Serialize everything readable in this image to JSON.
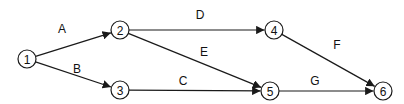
{
  "diagram": {
    "type": "activity-on-arrow network",
    "nodes": [
      {
        "id": "1",
        "label": "1",
        "x": 27,
        "y": 59
      },
      {
        "id": "2",
        "label": "2",
        "x": 120,
        "y": 30
      },
      {
        "id": "3",
        "label": "3",
        "x": 120,
        "y": 90
      },
      {
        "id": "4",
        "label": "4",
        "x": 274,
        "y": 30
      },
      {
        "id": "5",
        "label": "5",
        "x": 270,
        "y": 91
      },
      {
        "id": "6",
        "label": "6",
        "x": 383,
        "y": 91
      }
    ],
    "edges": [
      {
        "label": "A",
        "from": "1",
        "to": "2",
        "lx": 62,
        "ly": 29
      },
      {
        "label": "B",
        "from": "1",
        "to": "3",
        "lx": 77,
        "ly": 69
      },
      {
        "label": "C",
        "from": "3",
        "to": "5",
        "lx": 183,
        "ly": 81
      },
      {
        "label": "D",
        "from": "2",
        "to": "4",
        "lx": 200,
        "ly": 15
      },
      {
        "label": "E",
        "from": "2",
        "to": "5",
        "lx": 204,
        "ly": 52
      },
      {
        "label": "F",
        "from": "4",
        "to": "6",
        "lx": 337,
        "ly": 45
      },
      {
        "label": "G",
        "from": "5",
        "to": "6",
        "lx": 315,
        "ly": 81
      }
    ]
  }
}
